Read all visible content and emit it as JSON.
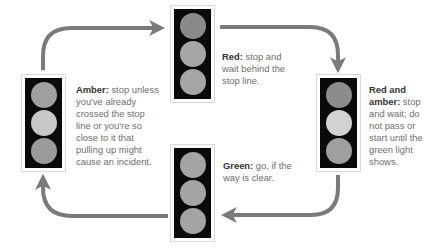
{
  "colors": {
    "arrow": "#7a7a7a",
    "housing": "#0a0a0a",
    "frame": "#d8d8d8",
    "label": "#333333",
    "body_text": "#6e6e6e"
  },
  "states": [
    {
      "id": "red",
      "label": "Red:",
      "text": " stop and wait behind the stop line.",
      "lamps": [
        "#8a8a8a",
        "#a6a6a6",
        "#a6a6a6"
      ]
    },
    {
      "id": "red-and-amber",
      "label": "Red and amber:",
      "text": " stop and wait; do not pass or start until the green light shows.",
      "lamps": [
        "#8c8c8c",
        "#d2d2d2",
        "#a0a0a0"
      ]
    },
    {
      "id": "green",
      "label": "Green:",
      "text": " go, if the way is clear.",
      "lamps": [
        "#a4a4a4",
        "#a4a4a4",
        "#a4a4a4"
      ]
    },
    {
      "id": "amber",
      "label": "Amber:",
      "text": " stop unless you've already crossed the stop line or you're so close to it that pulling up might cause an incident.",
      "lamps": [
        "#a0a0a0",
        "#c8c8c8",
        "#9a9a9a"
      ]
    }
  ]
}
